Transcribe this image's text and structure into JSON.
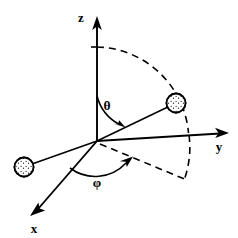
{
  "figure": {
    "background_color": "#ffffff",
    "ink_color": "#000000",
    "width": 238,
    "height": 238
  },
  "axes": [
    {
      "id": "z",
      "label": "z",
      "icon": "arrow-up-icon",
      "label_x": 81,
      "label_y": 22,
      "origin": [
        97,
        141
      ],
      "tip": [
        97,
        18
      ],
      "direction": "up"
    },
    {
      "id": "y",
      "label": "y",
      "icon": "arrow-right-icon",
      "label_x": 219,
      "label_y": 150,
      "origin": [
        97,
        141
      ],
      "tip": [
        228,
        133
      ],
      "direction": "right"
    },
    {
      "id": "x",
      "label": "x",
      "icon": "arrow-down-left-icon",
      "label_x": 33,
      "label_y": 232,
      "origin": [
        97,
        141
      ],
      "tip": [
        31,
        214
      ],
      "direction": "down-left"
    }
  ],
  "angles": [
    {
      "id": "theta",
      "label": "θ",
      "label_x": 107,
      "label_y": 109,
      "description": "polar angle measured from the z-axis down to the radius vector",
      "arc_from_axis": "z",
      "arc_to": "radius-vector",
      "arrow": "arc-arrow-icon"
    },
    {
      "id": "phi",
      "label": "φ",
      "label_x": 96,
      "label_y": 186,
      "description": "azimuthal angle measured from the x-axis around to the projection of the radius vector",
      "arc_from_axis": "x",
      "arc_to": "projection-line",
      "arrow": "arc-arrow-icon"
    }
  ],
  "particles": [
    {
      "id": "particle-upper-right",
      "icon": "sphere-icon",
      "cx": 176,
      "cy": 103,
      "r": 9.5,
      "texture": "stippled",
      "description": "particle located at the end of the radius vector in the shaded sector"
    },
    {
      "id": "particle-lower-left",
      "icon": "sphere-icon",
      "cx": 24,
      "cy": 167,
      "r": 9.5,
      "texture": "stippled",
      "description": "second particle on the ray extending to the lower left of the origin"
    }
  ],
  "regions": [
    {
      "id": "shaded-sector",
      "description": "stippled sector sweeping from the z-axis through the radius vector and past the y-axis",
      "boundary_style": "dashed-arc",
      "fill_texture": "stipple-dots"
    }
  ],
  "rays": [
    {
      "id": "radius-vector",
      "description": "line from origin to the upper-right particle",
      "from": [
        97,
        141
      ],
      "to": [
        176,
        103
      ]
    },
    {
      "id": "projection-ray",
      "description": "line from origin to the lower-left particle",
      "from": [
        97,
        141
      ],
      "to": [
        24,
        167
      ]
    }
  ]
}
